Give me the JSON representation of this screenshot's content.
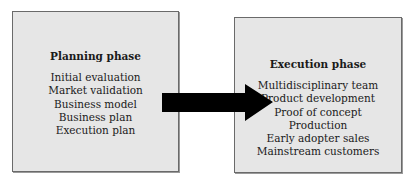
{
  "diagram": {
    "planning": {
      "title": "Planning phase",
      "items": [
        "Initial evaluation",
        "Market validation",
        "Business model",
        "Business plan",
        "Execution plan"
      ]
    },
    "execution": {
      "title": "Execution phase",
      "items": [
        "Multidisciplinary team",
        "Product development",
        "Proof of concept",
        "Production",
        "Early adopter sales",
        "Mainstream customers"
      ]
    },
    "connector": {
      "type": "arrow",
      "from": "Planning phase",
      "to": "Execution phase",
      "color": "#000000"
    },
    "colors": {
      "box_fill": "#e6e6e6",
      "box_border": "#6a6a6a"
    }
  }
}
